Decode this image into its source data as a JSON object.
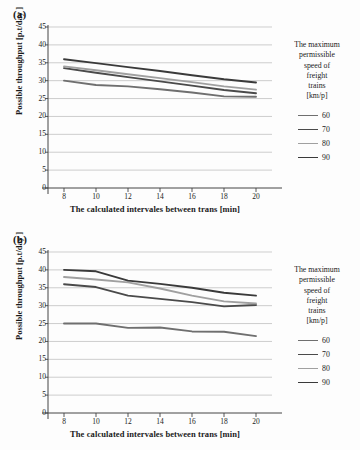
{
  "figure": {
    "panels": [
      {
        "label": "(a)",
        "ylabel": "Possible throughput  [p.t/day ]",
        "xlabel": "The calculated intervales  between  trans [min]"
      },
      {
        "label": "(b)",
        "ylabel": "Possible throughput  [p.t/day ]",
        "xlabel": "The calculated intervales  between  trans [min]"
      }
    ],
    "legend": {
      "title_lines": [
        "The maximum",
        "permissible",
        "speed of",
        "freight",
        "trains",
        "[km/p]"
      ],
      "items": [
        {
          "label": "60",
          "color": "#6f6f6f"
        },
        {
          "label": "70",
          "color": "#4a4a4a"
        },
        {
          "label": "80",
          "color": "#a0a0a0"
        },
        {
          "label": "90",
          "color": "#3a3a3a"
        }
      ]
    }
  },
  "chart_data": [
    {
      "type": "line",
      "title": "(a)",
      "xlabel": "The calculated intervales  between  trans [min]",
      "ylabel": "Possible throughput  [p.t/day ]",
      "xlim": [
        7,
        21
      ],
      "ylim": [
        0,
        45
      ],
      "ytick_labels": [
        "0",
        "5",
        "10",
        "15",
        "20",
        "25",
        "30",
        "35",
        "40",
        "45"
      ],
      "yticks": [
        0,
        5,
        10,
        15,
        20,
        25,
        30,
        35,
        40,
        45
      ],
      "xticks": [
        8,
        10,
        12,
        14,
        16,
        18,
        20
      ],
      "xtick_labels": [
        "8",
        "10",
        "12",
        "14",
        "16",
        "18",
        "20"
      ],
      "x": [
        8,
        10,
        12,
        14,
        16,
        18,
        20
      ],
      "grid": "horizontal",
      "legend_position": "right",
      "series": [
        {
          "name": "60",
          "color": "#6f6f6f",
          "values": [
            30.0,
            28.8,
            28.4,
            27.6,
            26.7,
            25.6,
            25.5
          ]
        },
        {
          "name": "70",
          "color": "#4a4a4a",
          "values": [
            33.5,
            32.2,
            31.0,
            29.8,
            28.6,
            27.4,
            26.5
          ]
        },
        {
          "name": "80",
          "color": "#a0a0a0",
          "values": [
            34.0,
            32.9,
            31.8,
            30.7,
            29.6,
            28.4,
            27.5
          ]
        },
        {
          "name": "90",
          "color": "#3a3a3a",
          "values": [
            36.0,
            34.9,
            33.8,
            32.7,
            31.5,
            30.4,
            29.5
          ]
        }
      ]
    },
    {
      "type": "line",
      "title": "(b)",
      "xlabel": "The calculated intervales  between  trans [min]",
      "ylabel": "Possible throughput  [p.t/day ]",
      "xlim": [
        7,
        21
      ],
      "ylim": [
        0,
        45
      ],
      "ytick_labels": [
        "0",
        "5",
        "10",
        "15",
        "20",
        "25",
        "30",
        "35",
        "40",
        "45"
      ],
      "yticks": [
        0,
        5,
        10,
        15,
        20,
        25,
        30,
        35,
        40,
        45
      ],
      "xticks": [
        8,
        10,
        12,
        14,
        16,
        18,
        20
      ],
      "xtick_labels": [
        "8",
        "10",
        "12",
        "14",
        "16",
        "18",
        "20"
      ],
      "x": [
        8,
        10,
        12,
        14,
        16,
        18,
        20
      ],
      "grid": "horizontal",
      "legend_position": "right",
      "series": [
        {
          "name": "60",
          "color": "#6f6f6f",
          "values": [
            25.0,
            25.0,
            23.8,
            23.9,
            22.8,
            22.7,
            21.5
          ]
        },
        {
          "name": "70",
          "color": "#4a4a4a",
          "values": [
            36.0,
            35.2,
            32.8,
            31.9,
            31.0,
            29.8,
            30.2
          ]
        },
        {
          "name": "80",
          "color": "#a0a0a0",
          "values": [
            38.0,
            37.3,
            36.5,
            34.8,
            32.8,
            31.2,
            30.6
          ]
        },
        {
          "name": "90",
          "color": "#3a3a3a",
          "values": [
            40.0,
            39.6,
            37.0,
            36.1,
            35.0,
            33.6,
            32.8
          ]
        }
      ]
    }
  ]
}
